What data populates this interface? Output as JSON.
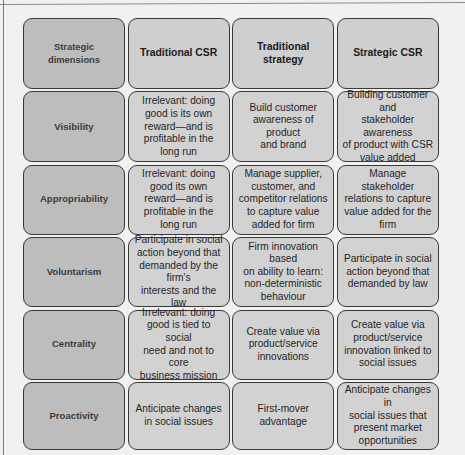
{
  "table": {
    "corner_label": "Strategic dimensions",
    "columns": [
      "Traditional CSR",
      "Traditional strategy",
      "Strategic CSR"
    ],
    "rows": [
      {
        "dimension": "Visibility",
        "cells": [
          "Irrelevant: doing\ngood is its own\nreward—and is\nprofitable in the\nlong run",
          "Build customer\nawareness of product\nand brand",
          "Building customer and\nstakeholder awareness\nof product with CSR\nvalue added"
        ]
      },
      {
        "dimension": "Appropriability",
        "cells": [
          "Irrelevant: doing\ngood its own\nreward—and is\nprofitable in the\nlong run",
          "Manage supplier,\ncustomer, and\ncompetitor relations\nto capture value\nadded for firm",
          "Manage stakeholder\nrelations to capture\nvalue added for the\nfirm"
        ]
      },
      {
        "dimension": "Voluntarism",
        "cells": [
          "Participate in social\naction beyond that\ndemanded by the firm's\ninterests and the law",
          "Firm innovation based\non ability to learn:\nnon-deterministic\nbehaviour",
          "Participate in social\naction beyond that\ndemanded by law"
        ]
      },
      {
        "dimension": "Centrality",
        "cells": [
          "Irrelevant: doing\ngood is tied to social\nneed and not to core\nbusiness mission",
          "Create value via\nproduct/service\ninnovations",
          "Create value via\nproduct/service\ninnovation linked to\nsocial issues"
        ]
      },
      {
        "dimension": "Proactivity",
        "cells": [
          "Anticipate changes\nin social issues",
          "First-mover advantage",
          "Anticipate changes in\nsocial issues that\npresent market\nopportunities"
        ]
      }
    ]
  },
  "colors": {
    "page_background": "#f1f1f0",
    "cell_fill": "#d2d2d2",
    "dimension_fill": "#bdbdbd",
    "cell_border": "#3a3a3a"
  }
}
